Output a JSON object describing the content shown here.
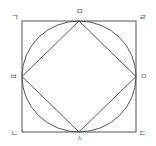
{
  "diagram": {
    "stroke_color": "#555555",
    "labels": {
      "top_left": "ㄱ",
      "bottom_left": "ㄴ",
      "bottom_right": "ㄷ",
      "top_right": "ㄹ",
      "top_mid": "ㅁ",
      "left_mid": "ㅂ",
      "bottom_mid": "ㅅ",
      "right_mid": "ㅇ"
    }
  }
}
